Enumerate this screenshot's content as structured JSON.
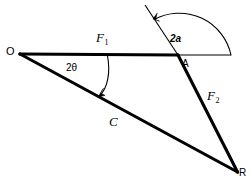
{
  "figure": {
    "type": "vector-force-diagram",
    "background_color": "#ffffff",
    "stroke_color": "#000000",
    "labels": {
      "origin": "O",
      "apex": "A",
      "resultant_end": "R",
      "force1": "F",
      "force1_subscript": "1",
      "force2": "F",
      "force2_subscript": "2",
      "chord": "C",
      "angle_half_apex": "2a",
      "angle_theta": "2θ"
    },
    "geometry": {
      "points": {
        "O": [
          20,
          54
        ],
        "A": [
          178,
          55
        ],
        "R": [
          237,
          172
        ],
        "horizontal_line_end": [
          231,
          55
        ],
        "oblique_top": [
          145,
          5
        ],
        "arc_arrow_tip_oblique": [
          153,
          18
        ],
        "arc_arrow_tip_chord": [
          98,
          97
        ],
        "theta_arrow_origin": [
          107,
          56
        ]
      },
      "segments": [
        {
          "name": "F1-vector-OA",
          "from": "O",
          "to": "A",
          "weight": "thick"
        },
        {
          "name": "horizontal-extension",
          "from": "A",
          "to": "horizontal_line_end",
          "weight": "thin"
        },
        {
          "name": "F2-vector-A-to-R",
          "from": "A",
          "to": "R",
          "weight": "thick"
        },
        {
          "name": "oblique-extension-above-A",
          "from": "oblique_top",
          "to": "A",
          "weight": "thin"
        },
        {
          "name": "C-vector-O-to-R",
          "from": "O",
          "to": "R",
          "weight": "thick"
        }
      ],
      "arcs": [
        {
          "name": "angle-2a-arc",
          "center": "A",
          "radius": 53,
          "from_deg": 0,
          "to_deg": 117,
          "arrowhead_at": "oblique"
        },
        {
          "name": "angle-2theta-arc",
          "center": "O",
          "radius": 88,
          "from_deg": 0,
          "to_deg": 27,
          "arrowhead_at": "chord"
        }
      ]
    },
    "label_positions": {
      "O": {
        "x": 6,
        "y": 47,
        "size": 11
      },
      "A": {
        "x": 182,
        "y": 59,
        "size": 10
      },
      "R": {
        "x": 239,
        "y": 168,
        "size": 10
      },
      "F1": {
        "x": 96,
        "y": 32,
        "size": 12
      },
      "F2": {
        "x": 207,
        "y": 90,
        "size": 12
      },
      "C": {
        "x": 109,
        "y": 116,
        "size": 12
      },
      "a2": {
        "x": 170,
        "y": 34,
        "size": 10
      },
      "t2": {
        "x": 66,
        "y": 63,
        "size": 10
      }
    }
  }
}
